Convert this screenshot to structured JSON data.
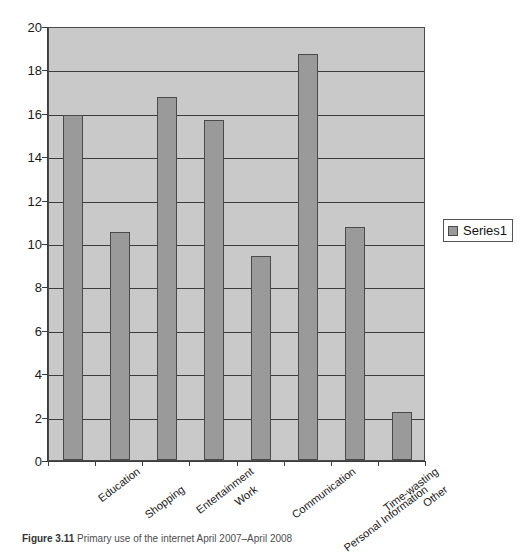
{
  "chart_data": {
    "type": "bar",
    "title": "",
    "xlabel": "",
    "ylabel": "",
    "ylim": [
      0,
      20
    ],
    "ytick_step": 2,
    "yticks": [
      0,
      2,
      4,
      6,
      8,
      10,
      12,
      14,
      16,
      18,
      20
    ],
    "grid": true,
    "legend_position": "right",
    "categories": [
      "Education",
      "Shopping",
      "Entertainment",
      "Work",
      "Communication",
      "Personal Information",
      "Time-wasting",
      "Other"
    ],
    "series": [
      {
        "name": "Series1",
        "values": [
          15.9,
          10.5,
          16.75,
          15.65,
          9.4,
          18.7,
          10.75,
          2.2
        ]
      }
    ],
    "colors": {
      "bar_fill": "#9a9a9a",
      "bar_border": "#4a4a4a",
      "plot_background": "#c9c9c9",
      "gridline": "#3c3c3c",
      "axis": "#3c3c3c",
      "text": "#1a1a1a"
    }
  },
  "legend": {
    "entries": [
      {
        "label": "Series1",
        "swatch_color": "#9a9a9a"
      }
    ]
  },
  "caption": {
    "figure_number": "Figure 3.11",
    "text": "Primary use of the internet April 2007–April 2008"
  }
}
